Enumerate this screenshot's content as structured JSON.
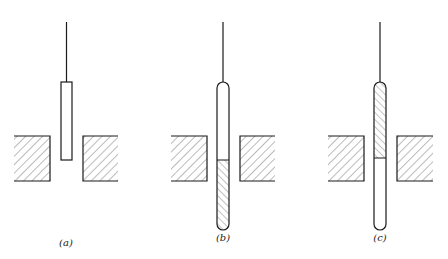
{
  "figure": {
    "panels": [
      {
        "id": "a",
        "label": "(a)",
        "description": "Short rod suspended on wire, lower end between two hatched pole blocks, no filling",
        "rod": {
          "x": 61,
          "y": 82,
          "w": 11,
          "h": 78,
          "rounded": false,
          "fill": "none"
        },
        "wire": {
          "x": 66.5,
          "y1": 22,
          "y2": 82
        },
        "left_block": {
          "x": 14,
          "y": 136,
          "w": 36,
          "h": 45
        },
        "right_block": {
          "x": 83,
          "y": 136,
          "w": 35,
          "h": 45
        },
        "label_pos": {
          "x": 66,
          "y": 246
        }
      },
      {
        "id": "b",
        "label": "(b)",
        "description": "Long rounded tube, lower half hatched (filled), boundary at middle of gap",
        "rod": {
          "x": 217,
          "y": 82,
          "w": 12,
          "h": 148,
          "rounded": true,
          "divider_y": 160,
          "hatched": "bottom"
        },
        "wire": {
          "x": 223,
          "y1": 22,
          "y2": 82
        },
        "left_block": {
          "x": 171,
          "y": 136,
          "w": 36,
          "h": 45
        },
        "right_block": {
          "x": 240,
          "y": 136,
          "w": 35,
          "h": 45
        },
        "label_pos": {
          "x": 223,
          "y": 241
        }
      },
      {
        "id": "c",
        "label": "(c)",
        "description": "Long rounded tube, upper half hatched (filled), boundary at middle of gap",
        "rod": {
          "x": 374,
          "y": 82,
          "w": 12,
          "h": 148,
          "rounded": true,
          "divider_y": 158,
          "hatched": "top"
        },
        "wire": {
          "x": 380,
          "y1": 22,
          "y2": 82
        },
        "left_block": {
          "x": 328,
          "y": 136,
          "w": 36,
          "h": 45
        },
        "right_block": {
          "x": 397,
          "y": 136,
          "w": 35,
          "h": 45
        },
        "label_pos": {
          "x": 380,
          "y": 241
        }
      }
    ],
    "colors": {
      "line": "#1a1a1a",
      "hatch": "#555555",
      "background": "#ffffff"
    }
  }
}
